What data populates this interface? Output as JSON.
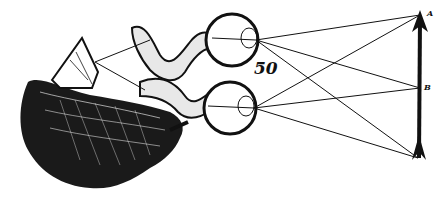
{
  "figure": {
    "figure_number": "50",
    "labels": {
      "top_point": "A",
      "middle_point": "B"
    },
    "colors": {
      "ink": "#111111",
      "paper": "#ffffff"
    },
    "elements": [
      "brain",
      "pineal-gland",
      "optic-nerves",
      "upper-eye",
      "lower-eye",
      "arrow",
      "light-rays"
    ]
  }
}
